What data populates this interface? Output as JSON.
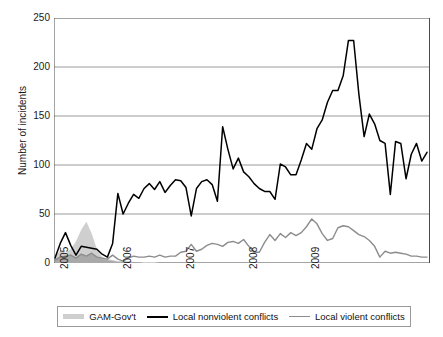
{
  "chart_data": {
    "type": "line",
    "title": "",
    "xlabel": "",
    "ylabel": "Number of incidents",
    "ylim": [
      0,
      250
    ],
    "yticks": [
      0,
      50,
      100,
      150,
      200,
      250
    ],
    "ytick_labels": [
      "0",
      "50",
      "100",
      "150",
      "200",
      "250"
    ],
    "xticks": [
      2005,
      2006,
      2007,
      2008,
      2009
    ],
    "xtick_labels": [
      "2005",
      "2006",
      "2007",
      "2008",
      "2009"
    ],
    "xlim": [
      2005.0,
      2009.98
    ],
    "grid": "horizontal",
    "legend_position": "bottom",
    "x_months": [
      "2005-01",
      "2005-02",
      "2005-03",
      "2005-04",
      "2005-05",
      "2005-06",
      "2005-07",
      "2005-08",
      "2005-09",
      "2005-10",
      "2005-11",
      "2005-12",
      "2006-01",
      "2006-02",
      "2006-03",
      "2006-04",
      "2006-05",
      "2006-06",
      "2006-07",
      "2006-08",
      "2006-09",
      "2006-10",
      "2006-11",
      "2006-12",
      "2007-01",
      "2007-02",
      "2007-03",
      "2007-04",
      "2007-05",
      "2007-06",
      "2007-07",
      "2007-08",
      "2007-09",
      "2007-10",
      "2007-11",
      "2007-12",
      "2008-01",
      "2008-02",
      "2008-03",
      "2008-04",
      "2008-05",
      "2008-06",
      "2008-07",
      "2008-08",
      "2008-09",
      "2008-10",
      "2008-11",
      "2008-12",
      "2009-01",
      "2009-02",
      "2009-03",
      "2009-04",
      "2009-05",
      "2009-06",
      "2009-07",
      "2009-08",
      "2009-09",
      "2009-10",
      "2009-11",
      "2009-12"
    ],
    "series": [
      {
        "name": "GAM-Gov't",
        "type": "area",
        "color": "#cfcfcf",
        "values": [
          8,
          12,
          10,
          14,
          22,
          34,
          42,
          30,
          14,
          6,
          4,
          3,
          2,
          2,
          2,
          1,
          1,
          1,
          1,
          1,
          0,
          0,
          0,
          0,
          0,
          0,
          0,
          0,
          0,
          0,
          0,
          0,
          0,
          0,
          0,
          0,
          0,
          0,
          0,
          0,
          0,
          0,
          0,
          0,
          0,
          0,
          0,
          0,
          0,
          0,
          0,
          0,
          0,
          0,
          0,
          0,
          0,
          0,
          0,
          0
        ]
      },
      {
        "name": "GAM-Gov't inner band",
        "type": "area",
        "color": "#a9a9a9",
        "values": [
          4,
          7,
          6,
          9,
          5,
          9,
          7,
          10,
          6,
          4,
          3,
          2,
          1,
          1,
          1,
          1,
          1,
          0,
          0,
          0,
          0,
          0,
          0,
          0,
          0,
          0,
          0,
          0,
          0,
          0,
          0,
          0,
          0,
          0,
          0,
          0,
          0,
          0,
          0,
          0,
          0,
          0,
          0,
          0,
          0,
          0,
          0,
          0,
          0,
          0,
          0,
          0,
          0,
          0,
          0,
          0,
          0,
          0,
          0,
          0
        ]
      },
      {
        "name": "Local nonviolent conflicts",
        "type": "line",
        "color": "#000000",
        "values": [
          5,
          20,
          31,
          18,
          8,
          17,
          16,
          15,
          14,
          9,
          6,
          20,
          71,
          50,
          61,
          70,
          66,
          76,
          81,
          75,
          83,
          72,
          79,
          85,
          84,
          77,
          48,
          76,
          83,
          85,
          80,
          63,
          139,
          116,
          96,
          107,
          93,
          88,
          81,
          76,
          73,
          73,
          65,
          101,
          98,
          90,
          90,
          105,
          122,
          116,
          137,
          146,
          164,
          176,
          176,
          191,
          227,
          227,
          172,
          129
        ],
        "values_extra": [
          152,
          142,
          125,
          122,
          70,
          124,
          122,
          86,
          111,
          122,
          104,
          113
        ]
      },
      {
        "name": "Local violent conflicts",
        "type": "line",
        "color": "#8c8c8c",
        "values": [
          3,
          6,
          7,
          8,
          5,
          9,
          7,
          10,
          6,
          5,
          4,
          8,
          4,
          2,
          5,
          7,
          6,
          6,
          7,
          6,
          8,
          6,
          7,
          7,
          11,
          12,
          19,
          12,
          14,
          18,
          20,
          19,
          17,
          21,
          22,
          20,
          24,
          17,
          11,
          11,
          21,
          29,
          23,
          30,
          26,
          31,
          28,
          31,
          37,
          45,
          40,
          30,
          23,
          25,
          36,
          38,
          37,
          33,
          29,
          27
        ],
        "values_extra": [
          23,
          17,
          6,
          12,
          10,
          11,
          10,
          9,
          7,
          7,
          6,
          6
        ]
      }
    ]
  },
  "axes": {
    "y_title": "Number of incidents"
  },
  "legend": {
    "items": [
      {
        "label": "GAM-Gov't",
        "swatch": "area-swatch",
        "color": "#cfcfcf"
      },
      {
        "label": "Local nonviolent conflicts",
        "swatch": "line-swatch-black",
        "color": "#000000"
      },
      {
        "label": "Local violent conflicts",
        "swatch": "line-swatch-gray",
        "color": "#8c8c8c"
      }
    ]
  }
}
